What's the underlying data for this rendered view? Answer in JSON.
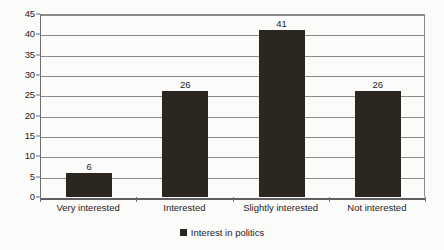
{
  "chart_data": {
    "type": "bar",
    "title": "",
    "xlabel": "",
    "ylabel": "",
    "categories": [
      "Very interested",
      "Interested",
      "Slightly interested",
      "Not interested"
    ],
    "values": [
      6,
      26,
      41,
      26
    ],
    "series": [
      {
        "name": "Interest in politics",
        "values": [
          6,
          26,
          41,
          26
        ]
      }
    ],
    "data_labels": [
      "6",
      "26",
      "41",
      "26"
    ],
    "ylim": [
      0,
      45
    ],
    "y_tick_step": 5,
    "y_ticks": [
      0,
      5,
      10,
      15,
      20,
      25,
      30,
      35,
      40,
      45
    ],
    "y_tick_labels": [
      "0",
      "5",
      "10",
      "15",
      "20",
      "25",
      "30",
      "35",
      "40",
      "45"
    ],
    "grid": true,
    "grid_axis": "y",
    "legend": {
      "position": "bottom",
      "entries": [
        {
          "label": "Interest in politics",
          "marker": "square",
          "color": "#2b2620"
        }
      ]
    },
    "colors": {
      "bar": "#2b2620",
      "gridline": "#8a8a8a",
      "axis": "#6e6e6e",
      "text": "#1d1d1d",
      "background": "#fbfbf9"
    }
  }
}
